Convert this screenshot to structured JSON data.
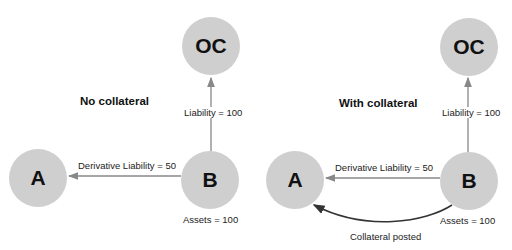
{
  "colors": {
    "node_fill": "#cfcfcf",
    "arrow_gray": "#888888",
    "arrow_dark": "#333333",
    "text": "#222222"
  },
  "panels": [
    {
      "title": "No collateral",
      "nodes": {
        "oc": "OC",
        "a": "A",
        "b": "B"
      },
      "edges": {
        "b_to_oc": "Liability = 100",
        "b_to_a": "Derivative Liability = 50"
      },
      "b_note": "Assets = 100"
    },
    {
      "title": "With collateral",
      "nodes": {
        "oc": "OC",
        "a": "A",
        "b": "B"
      },
      "edges": {
        "b_to_oc": "Liability = 100",
        "b_to_a": "Derivative Liability = 50",
        "collateral": "Collateral posted"
      },
      "b_note": "Assets = 100"
    }
  ]
}
